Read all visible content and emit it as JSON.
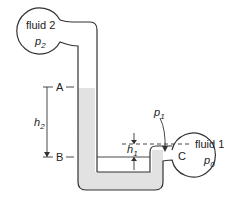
{
  "diagram": {
    "type": "manometer",
    "fluid2": {
      "name": "fluid 2",
      "pressure": "p",
      "pressure_sub": "2"
    },
    "fluid1": {
      "name": "fluid 1",
      "pressure": "p",
      "pressure_sub": "0"
    },
    "points": {
      "A": "A",
      "B": "B",
      "C": "C"
    },
    "heights": {
      "h1": {
        "symbol": "h",
        "sub": "1"
      },
      "h2": {
        "symbol": "h",
        "sub": "2"
      }
    },
    "p1": {
      "symbol": "p",
      "sub": "1"
    },
    "colors": {
      "stroke": "#333333",
      "liquid": "#e2e2e2",
      "background": "#ffffff"
    }
  }
}
